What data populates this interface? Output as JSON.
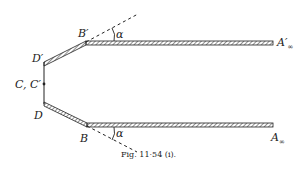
{
  "figure": {
    "caption": "Fig. 11·54 (i).",
    "labels": {
      "d_prime": "D′",
      "b_prime": "B′",
      "alpha_top": "α",
      "a_prime_inf": "A′",
      "a_prime_inf_sub": "∞",
      "c_c_prime": "C, C′",
      "d": "D",
      "b": "B",
      "alpha_bottom": "α",
      "a_inf": "A",
      "a_inf_sub": "∞"
    },
    "colors": {
      "ink": "#222222",
      "background": "#ffffff"
    }
  }
}
